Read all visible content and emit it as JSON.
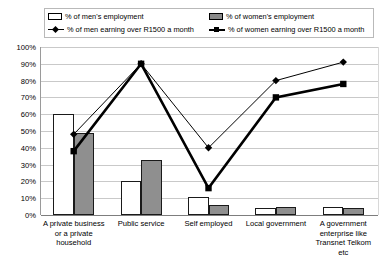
{
  "chart_data": {
    "type": "bar",
    "title": "",
    "subtitle": "",
    "xlabel": "",
    "ylabel": "",
    "ylim": [
      0,
      100
    ],
    "ytick_labels": [
      "100%",
      "90%",
      "80%",
      "70%",
      "60%",
      "50%",
      "40%",
      "30%",
      "20%",
      "10%",
      "0%"
    ],
    "ytick_values": [
      100,
      90,
      80,
      70,
      60,
      50,
      40,
      30,
      20,
      10,
      0
    ],
    "grid": true,
    "legend_position": "top",
    "categories": [
      "A private business or a private household",
      "Public service",
      "Self employed",
      "Local government",
      "A government enterprise like Transnet Telkom etc"
    ],
    "category_lines": [
      [
        "A private business",
        "or a private",
        "household"
      ],
      [
        "Public service"
      ],
      [
        "Self employed"
      ],
      [
        "Local government"
      ],
      [
        "A government",
        "enterprise like",
        "Transnet Telkom",
        "etc"
      ]
    ],
    "series": [
      {
        "name": "% of men's employment",
        "kind": "bar",
        "color": "#ffffff",
        "edge_color": "#1a1a1a",
        "values": [
          60,
          20,
          11,
          4,
          5
        ]
      },
      {
        "name": "% of women's employment",
        "kind": "bar",
        "color": "#8f8f8f",
        "edge_color": "#1a1a1a",
        "values": [
          49,
          33,
          6,
          5,
          4
        ]
      },
      {
        "name": "% of men earning over R1500 a month",
        "kind": "line",
        "color": "#000000",
        "marker": "diamond",
        "line_width": "thin",
        "values": [
          48,
          90,
          40,
          80,
          91
        ]
      },
      {
        "name": "% of women earning over R1500 a month",
        "kind": "line",
        "color": "#000000",
        "marker": "square",
        "line_width": "thick",
        "values": [
          38,
          90,
          16,
          70,
          78
        ]
      }
    ]
  },
  "legend": {
    "men_employment": "% of men's employment",
    "women_employment": "% of women's employment",
    "men_earning": "% of men earning over R1500 a month",
    "women_earning": "% of women earning over R1500 a month"
  }
}
